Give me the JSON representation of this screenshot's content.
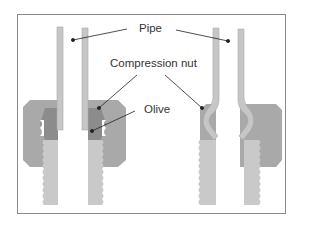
{
  "diagram": {
    "type": "technical-cross-section",
    "labels": {
      "pipe": "Pipe",
      "compression_nut": "Compression nut",
      "olive": "Olive"
    },
    "panels": [
      {
        "id": "before",
        "description": "Olive uncompressed, pipe straight"
      },
      {
        "id": "after",
        "description": "Olive compressed onto pipe"
      }
    ],
    "colors": {
      "pipe": "#c6c6c6",
      "pipe_edge": "#a8a8a8",
      "nut": "#a9a9a9",
      "olive": "#8c8c8c",
      "body": "#c9c9c9",
      "frame": "#8a8a8a",
      "text": "#333333",
      "leader": "#222222"
    }
  }
}
